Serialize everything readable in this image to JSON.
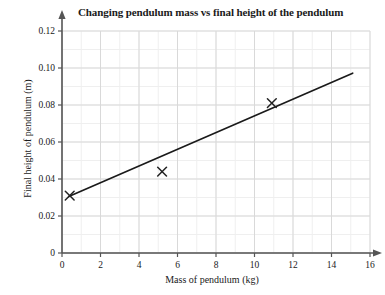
{
  "chart_data": {
    "type": "scatter",
    "title": "Changing pendulum mass vs final height of the pendulum",
    "xlabel": "Mass of pendulum (kg)",
    "ylabel": "Final height of pendulum (m)",
    "xlim": [
      0,
      16
    ],
    "ylim": [
      0,
      0.12
    ],
    "xticks": [
      0,
      2,
      4,
      6,
      8,
      10,
      12,
      14,
      16
    ],
    "xtick_labels": [
      "0",
      "2",
      "4",
      "6",
      "8",
      "10",
      "12",
      "14",
      "16"
    ],
    "yticks": [
      0,
      0.02,
      0.04,
      0.06,
      0.08,
      0.1,
      0.12
    ],
    "ytick_labels": [
      "0",
      "0.02",
      "0.04",
      "0.06",
      "0.08",
      "0.10",
      "0.12"
    ],
    "grid": true,
    "minor_grid": true,
    "x_minor_step": 1,
    "y_minor_step": 0.01,
    "legend": false,
    "marker": "x-cross",
    "marker_color": "#222222",
    "grid_color": "#d9d9d9",
    "minor_grid_color": "#efefef",
    "axis_color": "#555555",
    "line_color": "#1a1a1a",
    "points": [
      {
        "x": 0.4,
        "y": 0.031
      },
      {
        "x": 5.2,
        "y": 0.044
      },
      {
        "x": 10.9,
        "y": 0.081
      }
    ],
    "trendline": {
      "name": "line of best fit",
      "x_start": 0.35,
      "y_start": 0.0305,
      "x_end": 15.1,
      "y_end": 0.0972
    }
  }
}
